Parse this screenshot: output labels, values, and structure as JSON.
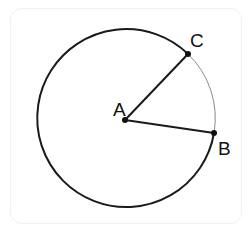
{
  "diagram": {
    "points": {
      "A": {
        "label": "A",
        "x": 125,
        "y": 120
      },
      "B": {
        "label": "B",
        "x": 214,
        "y": 133
      },
      "C": {
        "label": "C",
        "x": 188,
        "y": 54
      }
    },
    "circle": {
      "cx": 125,
      "cy": 120,
      "r": 89
    },
    "segments": [
      "AB",
      "AC"
    ],
    "arcs": {
      "minor_CB": "thin gray",
      "major_CB": "thick black"
    },
    "colors": {
      "stroke": "#1a1a1a",
      "minor_arc": "#888888"
    }
  }
}
